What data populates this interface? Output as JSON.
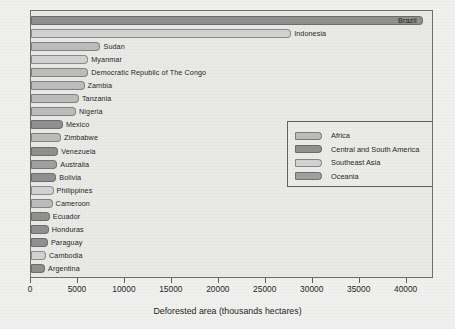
{
  "chart_data": {
    "type": "bar",
    "orientation": "horizontal",
    "title": "",
    "xlabel": "Deforested area (thousands hectares)",
    "ylabel": "",
    "xlim": [
      0,
      42700
    ],
    "xticks": [
      0,
      5000,
      10000,
      15000,
      20000,
      25000,
      30000,
      35000,
      40000
    ],
    "xtick_labels": [
      "0",
      "5000",
      "10000",
      "15000",
      "20000",
      "25000",
      "30000",
      "35000",
      "40000"
    ],
    "grid": false,
    "legend_position": "center-right",
    "categories": [
      "Brazil",
      "Indonesia",
      "Sudan",
      "Myanmar",
      "Democratic Republic of The Congo",
      "Zambia",
      "Tanzania",
      "Nigeria",
      "Mexico",
      "Zimbabwe",
      "Venezuela",
      "Australia",
      "Bolivia",
      "Philippines",
      "Cameroon",
      "Ecuador",
      "Honduras",
      "Paraguay",
      "Cambodia",
      "Argentina"
    ],
    "values": [
      41700,
      27700,
      7400,
      6100,
      6100,
      5700,
      5100,
      4800,
      3400,
      3200,
      2900,
      2800,
      2700,
      2400,
      2300,
      2000,
      1900,
      1800,
      1600,
      1500
    ],
    "groups": [
      "Central and South America",
      "Southeast Asia",
      "Africa",
      "Southeast Asia",
      "Africa",
      "Africa",
      "Africa",
      "Africa",
      "Central and South America",
      "Africa",
      "Central and South America",
      "Oceania",
      "Central and South America",
      "Southeast Asia",
      "Africa",
      "Central and South America",
      "Central and South America",
      "Central and South America",
      "Southeast Asia",
      "Central and South America"
    ],
    "legend": [
      {
        "label": "Africa",
        "color": "#bcbcbc"
      },
      {
        "label": "Central and South America",
        "color": "#8f8f8f"
      },
      {
        "label": "Southeast Asia",
        "color": "#d2d2d2"
      },
      {
        "label": "Oceania",
        "color": "#9f9f9f"
      }
    ],
    "colors": {
      "Africa": "#bcbcbc",
      "Central and South America": "#8f8f8f",
      "Southeast Asia": "#d2d2d2",
      "Oceania": "#9f9f9f"
    }
  }
}
